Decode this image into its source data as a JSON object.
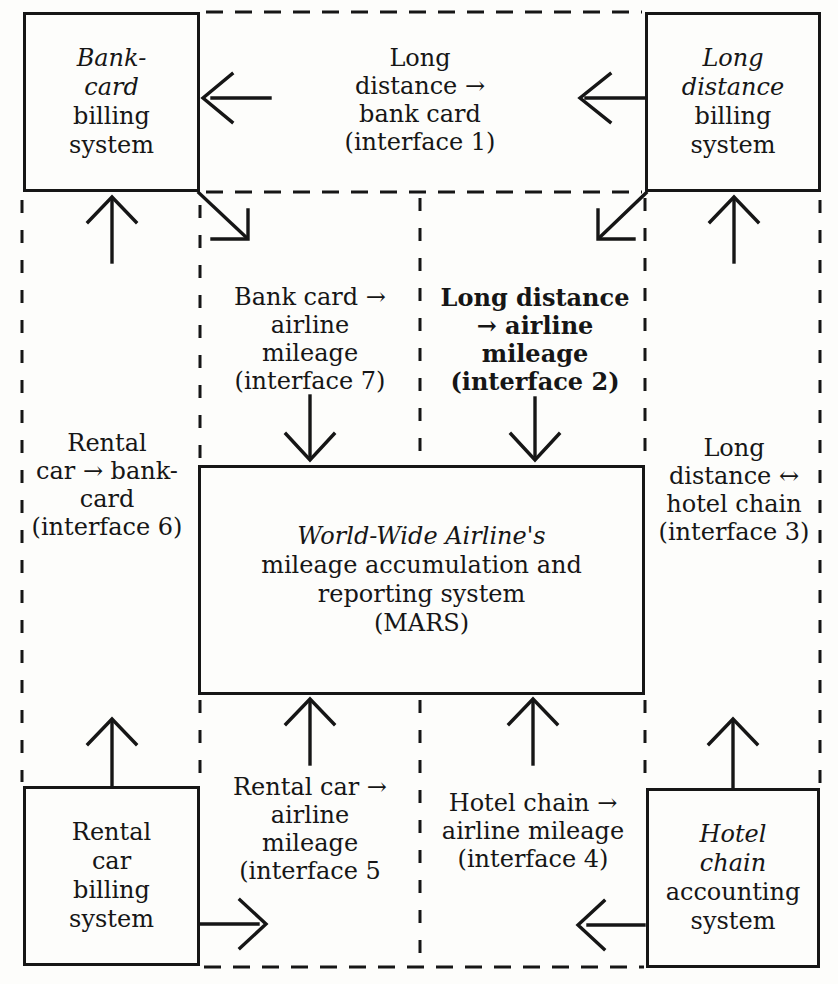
{
  "boxes": {
    "bank_card": {
      "lines": [
        "Bank-",
        "card",
        "billing",
        "system"
      ]
    },
    "long_distance": {
      "lines": [
        "Long",
        "distance",
        "billing",
        "system"
      ]
    },
    "mars": {
      "lines": [
        "World-Wide Airline's",
        "mileage accumulation and",
        "reporting system",
        "(MARS)"
      ]
    },
    "rental_car": {
      "lines": [
        "Rental",
        "car",
        "billing",
        "system"
      ]
    },
    "hotel_chain": {
      "lines": [
        "Hotel",
        "chain",
        "accounting",
        "system"
      ]
    }
  },
  "interface_labels": {
    "interface1": {
      "lines": [
        "Long",
        "distance →",
        "bank card",
        "(interface 1)"
      ]
    },
    "interface2": {
      "lines": [
        "Long distance",
        "→ airline",
        "mileage",
        "(interface 2)"
      ]
    },
    "interface3": {
      "lines": [
        "Long",
        "distance ↔",
        "hotel chain",
        "(interface 3)"
      ]
    },
    "interface4": {
      "lines": [
        "Hotel chain →",
        "airline mileage",
        "(interface 4)"
      ]
    },
    "interface5": {
      "lines": [
        "Rental car →",
        "airline",
        "mileage",
        "(interface 5"
      ]
    },
    "interface6": {
      "lines": [
        "Rental",
        "car → bank-",
        "card",
        "(interface 6)"
      ]
    },
    "interface7": {
      "lines": [
        "Bank card →",
        "airline",
        "mileage",
        "(interface 7)"
      ]
    }
  },
  "colors": {
    "ink": "#161616",
    "background": "#fdfdfb"
  }
}
